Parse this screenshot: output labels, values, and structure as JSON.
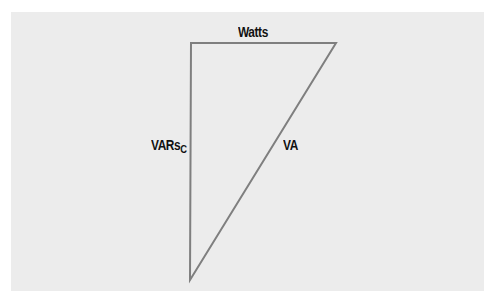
{
  "diagram": {
    "type": "power-triangle",
    "labels": {
      "top": "Watts",
      "left_main": "VARs",
      "left_sub": "C",
      "hypotenuse": "VA"
    },
    "colors": {
      "background": "#ececec",
      "line": "#7a7a7a",
      "text": "#111111"
    }
  }
}
